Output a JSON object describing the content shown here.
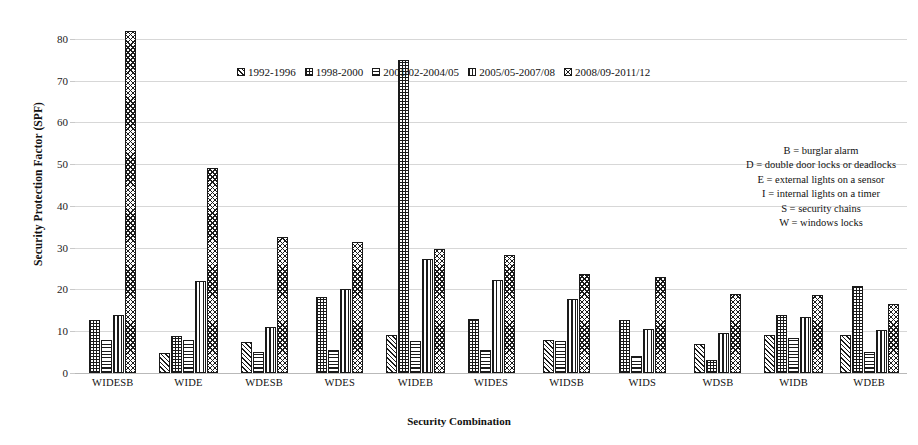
{
  "chart_data": {
    "type": "bar",
    "title": "",
    "xlabel": "Security Combination",
    "ylabel": "Security Protection Factor (SPF)",
    "ylim": [
      0,
      85
    ],
    "yticks": [
      0,
      10,
      20,
      30,
      40,
      50,
      60,
      70,
      80
    ],
    "grid": true,
    "legend_position": "top-center",
    "categories": [
      "WIDESB",
      "WIDE",
      "WDESB",
      "WDES",
      "WIDEB",
      "WIDES",
      "WIDSB",
      "WIDS",
      "WDSB",
      "WIDB",
      "WDEB"
    ],
    "series": [
      {
        "name": "1992-1996",
        "pattern": "diagonal",
        "values": [
          null,
          4.7,
          7.5,
          null,
          9.0,
          null,
          8.0,
          null,
          7.0,
          9.0,
          9.0
        ]
      },
      {
        "name": "1998-2000",
        "pattern": "dotted",
        "values": [
          12.7,
          8.8,
          null,
          18.3,
          75.0,
          13.0,
          null,
          12.8,
          3.0,
          13.8,
          20.8
        ]
      },
      {
        "name": "2001/02-2004/05",
        "pattern": "horizontal",
        "values": [
          8.0,
          7.8,
          5.0,
          5.6,
          7.7,
          5.5,
          7.7,
          4.0,
          null,
          8.5,
          5.0
        ]
      },
      {
        "name": "2005/05-2007/08",
        "pattern": "vertical",
        "values": [
          14.0,
          22.0,
          11.0,
          20.2,
          27.3,
          22.3,
          17.8,
          10.6,
          9.5,
          13.4,
          10.4
        ]
      },
      {
        "name": "2008/09-2011/12",
        "pattern": "crosshatch",
        "values": [
          82.0,
          49.0,
          32.5,
          31.4,
          29.6,
          28.3,
          23.6,
          23.1,
          18.8,
          18.7,
          16.6
        ]
      }
    ]
  },
  "key": {
    "lines": [
      "B = burglar alarm",
      "D = double door locks or deadlocks",
      "E = external lights on a sensor",
      "I = internal lights on a timer",
      "S = security chains",
      "W = windows locks"
    ]
  }
}
